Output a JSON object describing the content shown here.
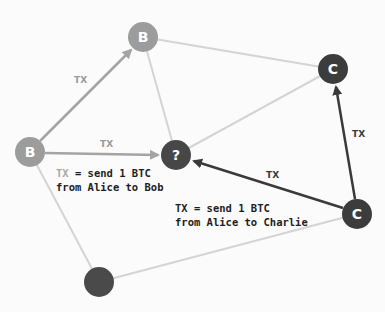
{
  "colors": {
    "b_node": "#9c9c9c",
    "dark_node": "#3c3c3c",
    "unknown_node": "#474747",
    "edge_light": "#d4d4d4",
    "arrow_b": "#a4a4a4",
    "arrow_c": "#3a3a3a"
  },
  "nodes": [
    {
      "id": "b_top",
      "label": "B",
      "x": 143,
      "y": 37,
      "color": "#9c9c9c"
    },
    {
      "id": "b_left",
      "label": "B",
      "x": 30,
      "y": 152,
      "color": "#9c9c9c"
    },
    {
      "id": "unknown",
      "label": "?",
      "x": 176,
      "y": 155,
      "color": "#474747"
    },
    {
      "id": "c_top",
      "label": "C",
      "x": 333,
      "y": 69,
      "color": "#3c3c3c"
    },
    {
      "id": "c_bottom",
      "label": "C",
      "x": 357,
      "y": 214,
      "color": "#3c3c3c"
    },
    {
      "id": "dark_bottom",
      "label": "",
      "x": 99,
      "y": 282,
      "color": "#4a4a4a"
    }
  ],
  "edges": {
    "tx_label": "TX"
  },
  "captions": {
    "bob": {
      "tx": "TX",
      "line1_rest": " = send 1 BTC",
      "line2": "from Alice to Bob"
    },
    "charlie": {
      "tx": "TX",
      "line1_rest": " = send 1 BTC",
      "line2": "from Alice to Charlie"
    }
  }
}
